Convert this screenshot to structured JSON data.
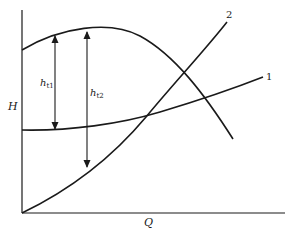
{
  "figure": {
    "y_axis_label": "H",
    "x_axis_label": "Q",
    "curve_labels": {
      "curve1": "1",
      "curve2": "2"
    },
    "dimension_labels": {
      "ht1_main": "h",
      "ht1_sub": "t1",
      "ht2_main": "h",
      "ht2_sub": "t2"
    }
  },
  "colors": {
    "line": "#1a1a1a",
    "background": "#ffffff"
  }
}
